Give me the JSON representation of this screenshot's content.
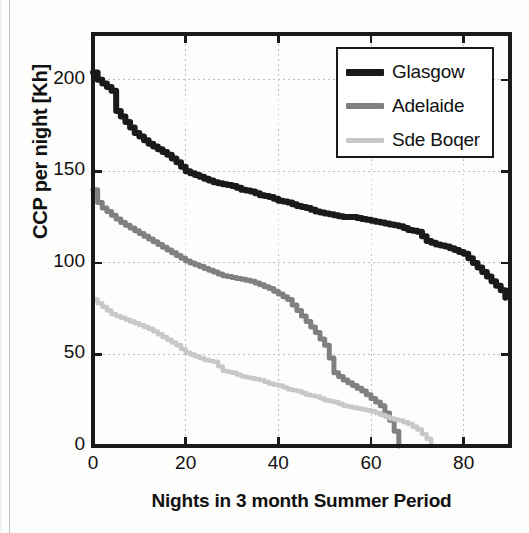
{
  "chart_data": {
    "type": "line",
    "title": "",
    "subtitle": "",
    "xlabel": "Nights in 3 month Summer Period",
    "ylabel": "CCP per night [Kh]",
    "xlim": [
      0,
      90
    ],
    "ylim": [
      0,
      225
    ],
    "xticks": [
      0,
      20,
      40,
      60,
      80
    ],
    "yticks": [
      0,
      50,
      100,
      150,
      200
    ],
    "xtick_labels": [
      "0",
      "20",
      "40",
      "60",
      "80"
    ],
    "ytick_labels": [
      "0",
      "50",
      "100",
      "150",
      "200"
    ],
    "grid": true,
    "grid_style": "dotted",
    "legend_position": "top-right",
    "series": [
      {
        "name": "Glasgow",
        "color": "#1a1a1a",
        "x": [
          0,
          1,
          2,
          3,
          4,
          5,
          6,
          7,
          8,
          9,
          10,
          12,
          14,
          16,
          18,
          20,
          22,
          24,
          26,
          28,
          30,
          32,
          34,
          36,
          38,
          40,
          42,
          44,
          46,
          48,
          50,
          52,
          54,
          56,
          58,
          60,
          62,
          64,
          66,
          68,
          70,
          72,
          74,
          76,
          78,
          80,
          82,
          84,
          86,
          88,
          89
        ],
        "y": [
          204,
          200,
          198,
          196,
          194,
          183,
          180,
          177,
          174,
          171,
          169,
          165,
          162,
          159,
          155,
          150,
          148,
          146,
          144,
          143,
          142,
          140,
          139,
          137,
          136,
          134,
          133,
          131,
          130,
          128,
          127,
          126,
          125,
          125,
          124,
          123,
          122,
          121,
          120,
          118,
          117,
          112,
          110,
          109,
          107,
          105,
          100,
          95,
          90,
          85,
          81
        ]
      },
      {
        "name": "Adelaide",
        "color": "#808080",
        "x": [
          0,
          1,
          2,
          3,
          4,
          5,
          6,
          8,
          10,
          12,
          14,
          16,
          18,
          20,
          22,
          24,
          26,
          28,
          30,
          32,
          34,
          36,
          38,
          40,
          42,
          44,
          46,
          48,
          50,
          51,
          52,
          53,
          54,
          56,
          58,
          60,
          62,
          64,
          65,
          66
        ],
        "y": [
          140,
          133,
          130,
          128,
          126,
          124,
          122,
          119,
          116,
          113,
          110,
          107,
          104,
          101,
          99,
          97,
          95,
          93,
          92,
          91,
          90,
          88,
          86,
          83,
          80,
          74,
          68,
          62,
          55,
          48,
          40,
          38,
          36,
          33,
          30,
          26,
          22,
          14,
          8,
          0
        ]
      },
      {
        "name": "Sde Boqer",
        "color": "#c8c8c8",
        "x": [
          0,
          1,
          2,
          3,
          4,
          6,
          8,
          10,
          12,
          14,
          16,
          18,
          20,
          22,
          24,
          26,
          28,
          30,
          32,
          34,
          36,
          38,
          40,
          42,
          44,
          46,
          48,
          50,
          52,
          54,
          56,
          58,
          60,
          62,
          64,
          66,
          68,
          70,
          72,
          73
        ],
        "y": [
          80,
          78,
          76,
          74,
          72,
          70,
          68,
          66,
          64,
          61,
          58,
          55,
          51,
          49,
          47,
          46,
          41,
          40,
          38,
          37,
          36,
          34,
          33,
          31,
          30,
          28,
          27,
          25,
          24,
          22,
          21,
          20,
          19,
          17,
          15,
          14,
          12,
          9,
          4,
          0
        ]
      }
    ]
  },
  "legend": {
    "items": [
      {
        "label": "Glasgow",
        "color": "#1a1a1a"
      },
      {
        "label": "Adelaide",
        "color": "#808080"
      },
      {
        "label": "Sde Boqer",
        "color": "#c8c8c8"
      }
    ]
  },
  "axes": {
    "x_title": "Nights in 3 month Summer Period",
    "y_title": "CCP per night [Kh]"
  },
  "colors": {
    "axis": "#1a1a1a",
    "grid": "#bdbdbd",
    "background": "#ffffff",
    "glasgow": "#1a1a1a",
    "adelaide": "#808080",
    "sde_boqer": "#c8c8c8"
  }
}
